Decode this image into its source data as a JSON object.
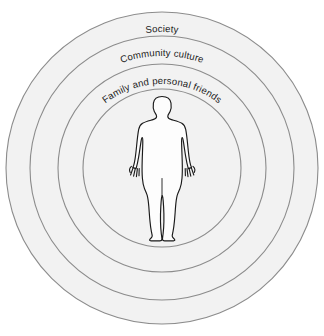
{
  "diagram": {
    "type": "concentric-circles",
    "background_color": "#ffffff",
    "ring_fill_color": "#f2f2f2",
    "ring_stroke_color": "#8c8c8c",
    "label_color": "#1c1c1c",
    "center": {
      "x": 162,
      "y": 168
    },
    "rings": [
      {
        "id": "society",
        "label": "Society",
        "radius": 156,
        "order": 1
      },
      {
        "id": "community-culture",
        "label": "Community culture",
        "radius": 132,
        "order": 2
      },
      {
        "id": "family-and-friends",
        "label": "Family and personal friends",
        "radius": 104,
        "order": 3
      },
      {
        "id": "person",
        "label": "",
        "radius": 79,
        "order": 4
      }
    ],
    "center_figure": {
      "name": "human-figure",
      "description": "human body silhouette",
      "fill_color": "#fdfdfd",
      "outline_color": "#1a1a1a"
    }
  }
}
